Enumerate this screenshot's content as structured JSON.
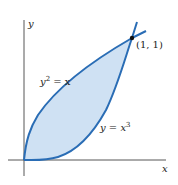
{
  "diagram": {
    "axes": {
      "x_label": "x",
      "y_label": "y"
    },
    "curves": [
      {
        "name": "upper",
        "label_base": "y",
        "label_exp": "2",
        "label_rest": " = x",
        "equation": "y^2 = x"
      },
      {
        "name": "lower",
        "label_base": "y = x",
        "label_exp": "3",
        "equation": "y = x^3"
      }
    ],
    "intersection_point": {
      "label": "(1, 1)",
      "x": 1,
      "y": 1
    },
    "colors": {
      "curve": "#2a6db5",
      "fill": "#cfe1f3",
      "axis": "#444444",
      "point": "#111111"
    }
  }
}
